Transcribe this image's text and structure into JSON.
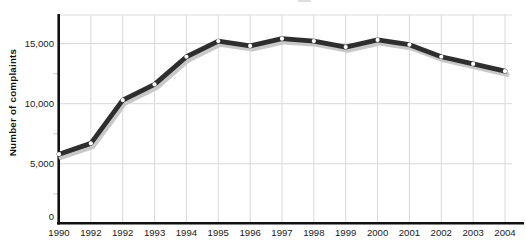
{
  "chart_data": {
    "type": "line",
    "title": "",
    "xlabel": "",
    "ylabel": "Number of complaints",
    "categories": [
      "1990",
      "1992",
      "1992",
      "1993",
      "1994",
      "1995",
      "1996",
      "1997",
      "1998",
      "1999",
      "2000",
      "2001",
      "2002",
      "2003",
      "2004"
    ],
    "values": [
      5800,
      6700,
      10300,
      11600,
      13900,
      15200,
      14800,
      15400,
      15200,
      14700,
      15300,
      14900,
      13900,
      13300,
      12700
    ],
    "series_name": "Number of complaints",
    "ylim": [
      0,
      17500
    ],
    "ytick_values": [
      0,
      5000,
      10000,
      15000
    ],
    "ytick_labels": [
      "0",
      "5,000",
      "10,000",
      "15,000"
    ],
    "minor_ytick_values": [
      2500,
      7500,
      12500
    ],
    "grid": true,
    "legend": "none",
    "colors": {
      "line": "#2e2e2e",
      "line_shadow": "#c8c8c8",
      "marker": "#ffffff",
      "grid": "#d9d9d9",
      "minor_tick": "#cfcfcf",
      "axis": "#111111",
      "label_text": "#1a1a1a"
    }
  }
}
